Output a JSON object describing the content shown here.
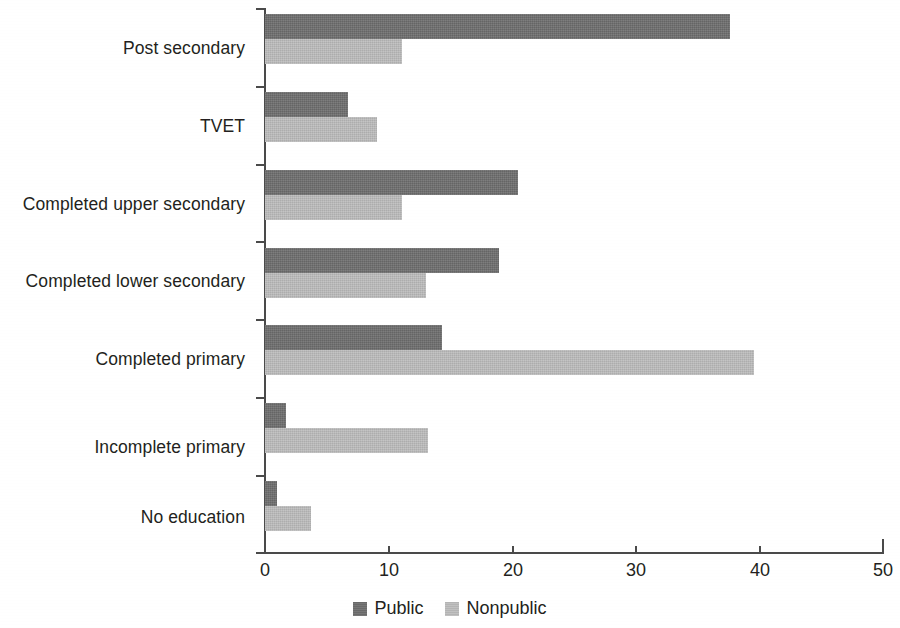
{
  "chart_data": {
    "type": "bar",
    "orientation": "horizontal",
    "title": "",
    "subtitle": "",
    "xlabel": "",
    "ylabel": "",
    "xlim": [
      0,
      50
    ],
    "xticks": [
      0,
      10,
      20,
      30,
      40,
      50
    ],
    "xtick_labels": [
      "0",
      "10",
      "20",
      "30",
      "40",
      "50"
    ],
    "grid": false,
    "legend_position": "bottom-center",
    "categories": [
      "Post secondary",
      "TVET",
      "Completed upper secondary",
      "Completed lower secondary",
      "Completed primary",
      "Incomplete primary",
      "No education"
    ],
    "series": [
      {
        "name": "Public",
        "color": "#6f6f6f",
        "values": [
          37.6,
          6.7,
          20.5,
          18.9,
          14.3,
          1.7,
          1.0
        ]
      },
      {
        "name": "Nonpublic",
        "color": "#bcbcbc",
        "values": [
          11.1,
          9.1,
          11.1,
          13.0,
          39.6,
          13.2,
          3.7
        ]
      }
    ],
    "legend": [
      {
        "label": "Public",
        "color": "#6f6f6f"
      },
      {
        "label": "Nonpublic",
        "color": "#bcbcbc"
      }
    ]
  },
  "axis": {
    "x_tick_labels": [
      "0",
      "10",
      "20",
      "30",
      "40",
      "50"
    ],
    "y_category_labels": [
      "Post secondary",
      "TVET",
      "Completed upper secondary",
      "Completed lower secondary",
      "Completed primary",
      "Incomplete primary",
      "No education"
    ]
  },
  "legend": {
    "items": [
      {
        "label": "Public"
      },
      {
        "label": "Nonpublic"
      }
    ]
  }
}
